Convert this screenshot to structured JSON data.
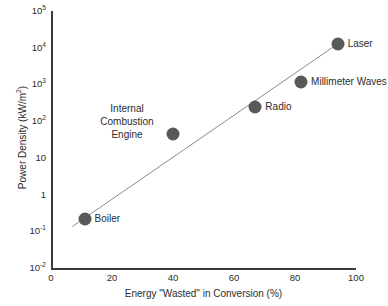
{
  "chart_data": {
    "type": "scatter",
    "title": "",
    "xlabel": "Energy \"Wasted\" in Conversion (%)",
    "ylabel": "Power Density (kW/m2)",
    "ylabel_base": "Power Density (kW/m",
    "ylabel_sup": "2",
    "ylabel_tail": ")",
    "xlim": [
      0,
      100
    ],
    "ylim": [
      0.01,
      100000
    ],
    "yscale": "log",
    "xscale": "linear",
    "grid": false,
    "legend": "none",
    "xticks": [
      "0",
      "20",
      "40",
      "60",
      "80",
      "100"
    ],
    "xtick_values": [
      0,
      20,
      40,
      60,
      80,
      100
    ],
    "yticks": [
      {
        "base": "10",
        "exp": "5",
        "value": 100000
      },
      {
        "base": "10",
        "exp": "4",
        "value": 10000
      },
      {
        "base": "10",
        "exp": "3",
        "value": 1000
      },
      {
        "base": "10",
        "exp": "2",
        "value": 100
      },
      {
        "base": "10",
        "exp": "",
        "value": 10
      },
      {
        "base": "1",
        "exp": "",
        "value": 1
      },
      {
        "base": "10",
        "exp": "-1",
        "value": 0.1
      },
      {
        "base": "10",
        "exp": "-2",
        "value": 0.01
      }
    ],
    "points": [
      {
        "label": "Boiler",
        "x": 11,
        "y": 0.22,
        "label_side": "right",
        "multiline": false
      },
      {
        "label": "Internal Combustion Engine",
        "x": 40,
        "y": 45,
        "label_side": "left",
        "multiline": true,
        "lines": [
          "Internal",
          "Combustion",
          "Engine"
        ]
      },
      {
        "label": "Radio",
        "x": 67,
        "y": 250,
        "label_side": "right",
        "multiline": false
      },
      {
        "label": "Millimeter Waves",
        "x": 82,
        "y": 1200,
        "label_side": "right",
        "multiline": false
      },
      {
        "label": "Laser",
        "x": 94,
        "y": 13000,
        "label_side": "right",
        "multiline": false
      }
    ],
    "trendline": {
      "type": "line",
      "x_start": 7,
      "y_start": 0.135,
      "x_end": 95,
      "y_end": 14500,
      "color": "#8a8a8a"
    },
    "marker_color": "#595959",
    "axis_color": "#3a3a3a",
    "text_color": "#2b2b2b",
    "background": "#ffffff"
  }
}
